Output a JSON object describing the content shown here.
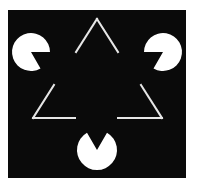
{
  "figure": {
    "title": "Kanizsa triangle illusion",
    "colors": {
      "page_background": "#ffffff",
      "panel_background": "#0a0a0a",
      "shape_fill": "#ffffff",
      "outline_stroke": "#e6e6e6"
    },
    "panel": {
      "x": 8,
      "y": 10,
      "width": 178,
      "height": 168
    },
    "pacmen": [
      {
        "name": "left",
        "cx": 31,
        "cy": 52,
        "r": 19,
        "mouth_start_deg": 0,
        "mouth_end_deg": 60
      },
      {
        "name": "right",
        "cx": 163,
        "cy": 52,
        "r": 19,
        "mouth_start_deg": 120,
        "mouth_end_deg": 180
      },
      {
        "name": "bottom",
        "cx": 97,
        "cy": 150,
        "r": 20,
        "mouth_start_deg": 240,
        "mouth_end_deg": 300
      }
    ],
    "outline_triangle": {
      "apex": [
        97,
        19
      ],
      "bottom_left": [
        33,
        118
      ],
      "bottom_right": [
        162,
        118
      ],
      "segments": [
        {
          "name": "apex-left",
          "x1": 97,
          "y1": 19,
          "x2": 76,
          "y2": 52
        },
        {
          "name": "apex-right",
          "x1": 97,
          "y1": 19,
          "x2": 118,
          "y2": 52
        },
        {
          "name": "left-lower",
          "x1": 54,
          "y1": 85,
          "x2": 33,
          "y2": 118
        },
        {
          "name": "left-bottom",
          "x1": 33,
          "y1": 118,
          "x2": 75,
          "y2": 118
        },
        {
          "name": "right-lower",
          "x1": 141,
          "y1": 85,
          "x2": 162,
          "y2": 118
        },
        {
          "name": "right-bottom",
          "x1": 118,
          "y1": 118,
          "x2": 162,
          "y2": 118
        }
      ],
      "stroke_width": 2
    }
  }
}
